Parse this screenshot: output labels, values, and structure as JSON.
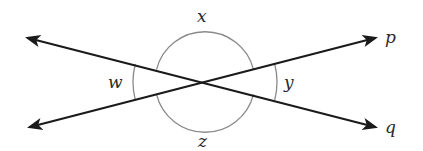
{
  "diagram": {
    "intersection": {
      "x": 205,
      "y": 82
    },
    "lines": [
      {
        "name": "p",
        "label": "p",
        "from": {
          "x": 30,
          "y": 127
        },
        "to": {
          "x": 375,
          "y": 38
        }
      },
      {
        "name": "q",
        "label": "q",
        "from": {
          "x": 375,
          "y": 127
        },
        "to": {
          "x": 28,
          "y": 38
        }
      }
    ],
    "angles": [
      {
        "name": "w",
        "label": "w",
        "position": "left"
      },
      {
        "name": "x",
        "label": "x",
        "position": "top"
      },
      {
        "name": "y",
        "label": "y",
        "position": "right"
      },
      {
        "name": "z",
        "label": "z",
        "position": "bottom"
      }
    ],
    "colors": {
      "line": "#1a1a1a",
      "arc": "#8a8a8a",
      "label": "#2a2a2a",
      "background": "#ffffff"
    }
  }
}
